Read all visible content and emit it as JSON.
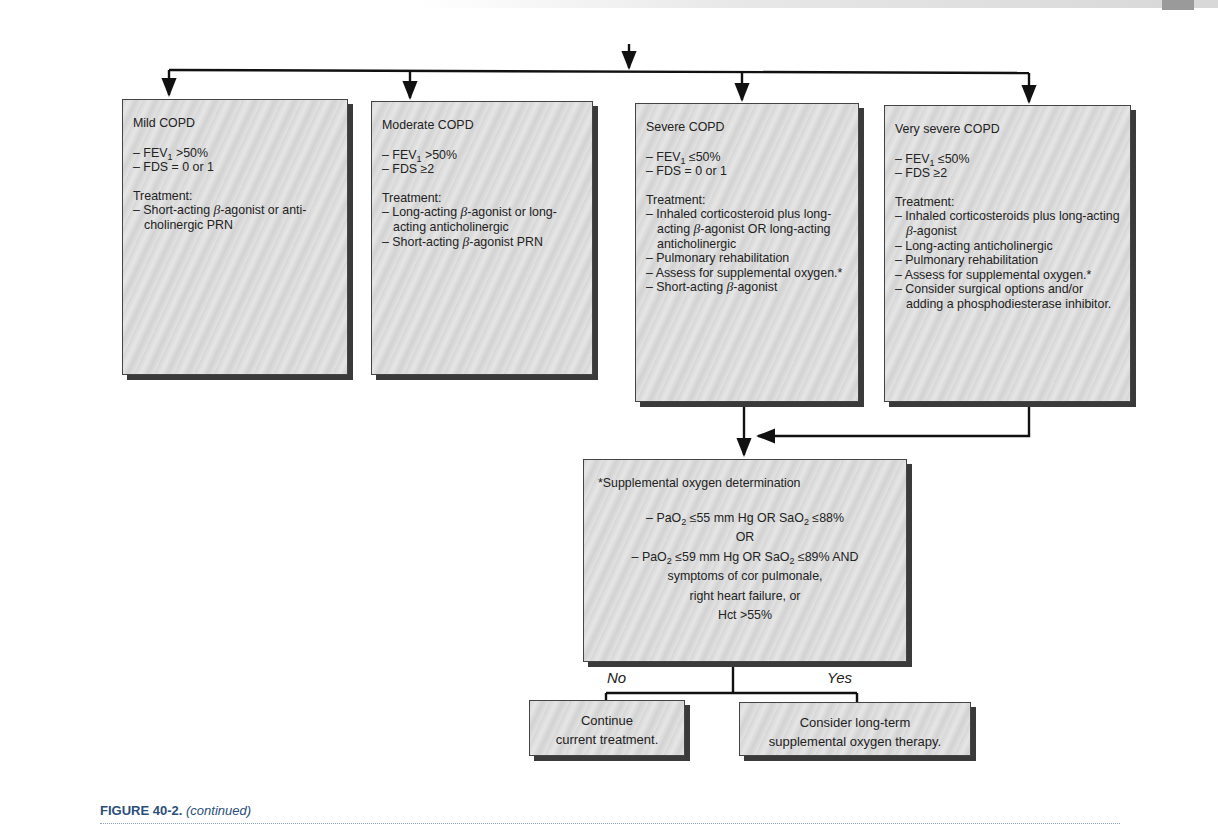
{
  "diagram": {
    "boxes": [
      {
        "id": "mild",
        "title": "Mild COPD",
        "criteria": [
          {
            "pre": "– FEV",
            "sub": "1",
            "post": " >50%"
          },
          {
            "pre": "– FDS = 0 or 1",
            "sub": "",
            "post": ""
          }
        ],
        "treatment_label": "Treatment:",
        "treatment": [
          "– Short-acting β-agonist or anti-cholinergic PRN"
        ]
      },
      {
        "id": "moderate",
        "title": "Moderate COPD",
        "criteria": [
          {
            "pre": "– FEV",
            "sub": "1",
            "post": " >50%"
          },
          {
            "pre": "– FDS ≥2",
            "sub": "",
            "post": ""
          }
        ],
        "treatment_label": "Treatment:",
        "treatment": [
          "– Long-acting β-agonist or long-acting anticholinergic",
          "– Short-acting β-agonist PRN"
        ]
      },
      {
        "id": "severe",
        "title": "Severe COPD",
        "criteria": [
          {
            "pre": "– FEV",
            "sub": "1",
            "post": " ≤50%"
          },
          {
            "pre": "– FDS = 0 or 1",
            "sub": "",
            "post": ""
          }
        ],
        "treatment_label": "Treatment:",
        "treatment": [
          "– Inhaled corticosteroid plus long-acting β-agonist OR long-acting anticholinergic",
          "– Pulmonary rehabilitation",
          "– Assess for supplemental oxygen.*",
          "– Short-acting β-agonist"
        ]
      },
      {
        "id": "very-severe",
        "title": "Very severe COPD",
        "criteria": [
          {
            "pre": "– FEV",
            "sub": "1",
            "post": " ≤50%"
          },
          {
            "pre": "– FDS ≥2",
            "sub": "",
            "post": ""
          }
        ],
        "treatment_label": "Treatment:",
        "treatment": [
          "– Inhaled corticosteroids plus long-acting β-agonist",
          "– Long-acting anticholinergic",
          "– Pulmonary rehabilitation",
          "– Assess for supplemental oxygen.*",
          "– Consider surgical options and/or adding a phosphodiesterase inhibitor."
        ]
      }
    ],
    "oxygen": {
      "title": "*Supplemental oxygen determination",
      "line1": {
        "a": "– PaO",
        "a_sub": "2",
        "b": " ≤55 mm Hg OR SaO",
        "b_sub": "2",
        "c": " ≤88%"
      },
      "or": "OR",
      "line2": {
        "a": "– PaO",
        "a_sub": "2",
        "b": " ≤59 mm Hg OR SaO",
        "b_sub": "2",
        "c": " ≤89% AND"
      },
      "line3": "symptoms of cor pulmonale,",
      "line4": "right heart failure, or",
      "line5": "Hct >55%"
    },
    "branch_no": "No",
    "branch_yes": "Yes",
    "outcome_no": [
      "Continue",
      "current treatment."
    ],
    "outcome_yes": [
      "Consider long-term",
      "supplemental oxygen therapy."
    ]
  },
  "caption": {
    "figure": "FIGURE 40-2.",
    "note": "(continued)"
  },
  "colors": {
    "caption": "#2a4f7a",
    "box_fill": "#dcdcdc",
    "box_shadow": "#3a3a3a",
    "line": "#111111"
  }
}
